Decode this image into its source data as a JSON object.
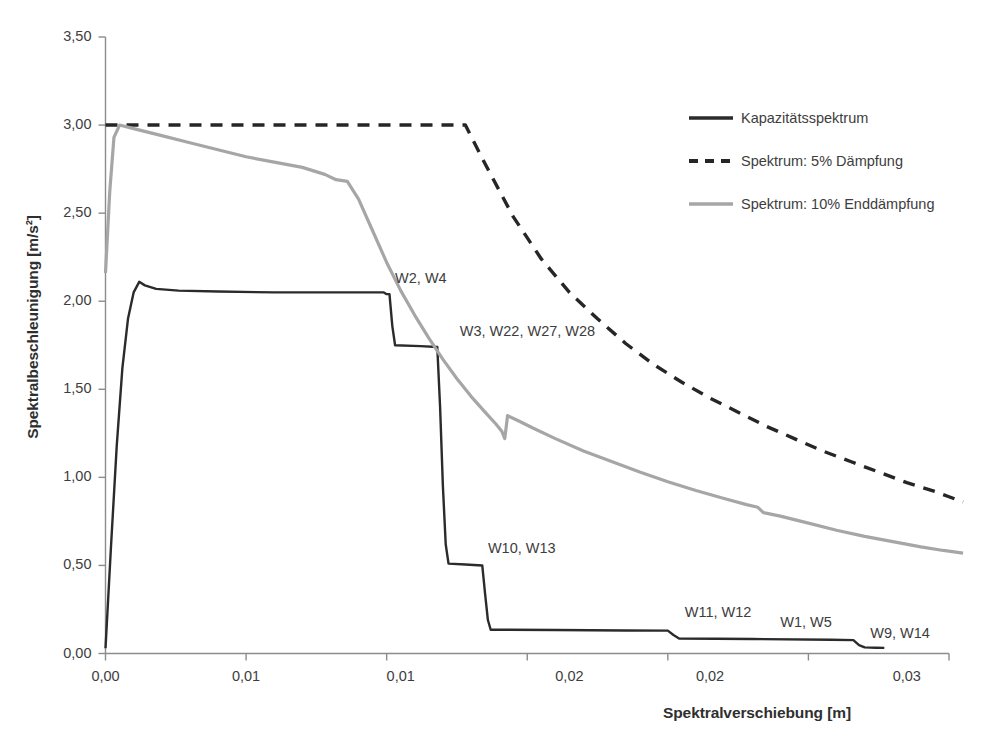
{
  "chart_data": {
    "type": "line",
    "title": "",
    "xlabel": "Spektralverschiebung [m]",
    "ylabel": "Spektralbeschleunigung [m/s²]",
    "xlim": [
      0,
      0.03
    ],
    "ylim": [
      0,
      3.5
    ],
    "grid": false,
    "legend_position": "top-right",
    "xticks": [
      0,
      0.005,
      0.01,
      0.015,
      0.02,
      0.025,
      0.03
    ],
    "xtick_labels": [
      "0,00",
      "0,01",
      "0,01",
      "0,02",
      "0,02",
      "0,03"
    ],
    "yticks": [
      0,
      0.5,
      1.0,
      1.5,
      2.0,
      2.5,
      3.0,
      3.5
    ],
    "ytick_labels": [
      "0,00",
      "0,50",
      "1,00",
      "1,50",
      "2,00",
      "2,50",
      "3,00",
      "3,50"
    ],
    "series": [
      {
        "name": "Kapazitätsspektrum",
        "style": "solid",
        "color": "#2b2b2b",
        "points": [
          [
            0.0,
            0.03
          ],
          [
            0.0002,
            0.62
          ],
          [
            0.0004,
            1.18
          ],
          [
            0.0006,
            1.62
          ],
          [
            0.0008,
            1.9
          ],
          [
            0.001,
            2.05
          ],
          [
            0.0012,
            2.11
          ],
          [
            0.0014,
            2.09
          ],
          [
            0.0018,
            2.07
          ],
          [
            0.0026,
            2.06
          ],
          [
            0.004,
            2.055
          ],
          [
            0.006,
            2.05
          ],
          [
            0.0085,
            2.05
          ],
          [
            0.0099,
            2.05
          ],
          [
            0.01,
            2.04
          ],
          [
            0.0101,
            2.04
          ],
          [
            0.0102,
            1.86
          ],
          [
            0.0103,
            1.75
          ],
          [
            0.0112,
            1.745
          ],
          [
            0.0118,
            1.74
          ],
          [
            0.0119,
            1.4
          ],
          [
            0.012,
            0.95
          ],
          [
            0.0121,
            0.62
          ],
          [
            0.0122,
            0.51
          ],
          [
            0.0128,
            0.505
          ],
          [
            0.0134,
            0.5
          ],
          [
            0.0135,
            0.34
          ],
          [
            0.0136,
            0.19
          ],
          [
            0.0137,
            0.135
          ],
          [
            0.016,
            0.133
          ],
          [
            0.0185,
            0.131
          ],
          [
            0.02,
            0.13
          ],
          [
            0.0202,
            0.105
          ],
          [
            0.0204,
            0.085
          ],
          [
            0.023,
            0.082
          ],
          [
            0.0258,
            0.078
          ],
          [
            0.0266,
            0.076
          ],
          [
            0.0268,
            0.048
          ],
          [
            0.027,
            0.035
          ],
          [
            0.0274,
            0.033
          ],
          [
            0.0277,
            0.032
          ]
        ]
      },
      {
        "name": "Spektrum: 5% Dämpfung",
        "style": "dashed",
        "color": "#262626",
        "points": [
          [
            0.0,
            3.0
          ],
          [
            0.002,
            3.0
          ],
          [
            0.004,
            3.0
          ],
          [
            0.006,
            3.0
          ],
          [
            0.008,
            3.0
          ],
          [
            0.01,
            3.0
          ],
          [
            0.0122,
            3.0
          ],
          [
            0.0128,
            3.0
          ],
          [
            0.0135,
            2.78
          ],
          [
            0.0145,
            2.48
          ],
          [
            0.0155,
            2.24
          ],
          [
            0.0165,
            2.05
          ],
          [
            0.0175,
            1.9
          ],
          [
            0.0185,
            1.76
          ],
          [
            0.0195,
            1.64
          ],
          [
            0.0205,
            1.54
          ],
          [
            0.0215,
            1.45
          ],
          [
            0.0225,
            1.37
          ],
          [
            0.0235,
            1.29
          ],
          [
            0.0245,
            1.22
          ],
          [
            0.0255,
            1.15
          ],
          [
            0.0265,
            1.09
          ],
          [
            0.0275,
            1.03
          ],
          [
            0.0285,
            0.97
          ],
          [
            0.0295,
            0.92
          ],
          [
            0.03,
            0.89
          ],
          [
            0.0305,
            0.86
          ]
        ]
      },
      {
        "name": "Spektrum: 10% Enddämpfung",
        "style": "solid",
        "color": "#a6a6a6",
        "points": [
          [
            0.0,
            2.16
          ],
          [
            0.00015,
            2.62
          ],
          [
            0.0003,
            2.93
          ],
          [
            0.0005,
            3.0
          ],
          [
            0.001,
            2.98
          ],
          [
            0.002,
            2.94
          ],
          [
            0.003,
            2.9
          ],
          [
            0.004,
            2.86
          ],
          [
            0.005,
            2.82
          ],
          [
            0.006,
            2.79
          ],
          [
            0.007,
            2.76
          ],
          [
            0.0078,
            2.72
          ],
          [
            0.0082,
            2.69
          ],
          [
            0.0086,
            2.68
          ],
          [
            0.009,
            2.58
          ],
          [
            0.0095,
            2.4
          ],
          [
            0.01,
            2.22
          ],
          [
            0.0105,
            2.06
          ],
          [
            0.011,
            1.92
          ],
          [
            0.0115,
            1.79
          ],
          [
            0.012,
            1.67
          ],
          [
            0.0125,
            1.56
          ],
          [
            0.013,
            1.46
          ],
          [
            0.0135,
            1.37
          ],
          [
            0.0139,
            1.3
          ],
          [
            0.0141,
            1.26
          ],
          [
            0.0142,
            1.22
          ],
          [
            0.0143,
            1.35
          ],
          [
            0.0147,
            1.32
          ],
          [
            0.0152,
            1.28
          ],
          [
            0.016,
            1.22
          ],
          [
            0.017,
            1.15
          ],
          [
            0.018,
            1.09
          ],
          [
            0.019,
            1.03
          ],
          [
            0.02,
            0.975
          ],
          [
            0.021,
            0.925
          ],
          [
            0.022,
            0.88
          ],
          [
            0.0228,
            0.845
          ],
          [
            0.0232,
            0.83
          ],
          [
            0.0234,
            0.8
          ],
          [
            0.024,
            0.78
          ],
          [
            0.025,
            0.74
          ],
          [
            0.026,
            0.7
          ],
          [
            0.027,
            0.665
          ],
          [
            0.028,
            0.635
          ],
          [
            0.029,
            0.605
          ],
          [
            0.0298,
            0.585
          ],
          [
            0.0305,
            0.57
          ]
        ]
      }
    ],
    "annotations": [
      {
        "text": "W2, W4",
        "x": 0.0103,
        "y": 2.12
      },
      {
        "text": "W3, W22, W27, W28",
        "x": 0.0126,
        "y": 1.82
      },
      {
        "text": "W10, W13",
        "x": 0.0136,
        "y": 0.59
      },
      {
        "text": "W11, W12",
        "x": 0.0206,
        "y": 0.225
      },
      {
        "text": "W1, W5",
        "x": 0.024,
        "y": 0.165
      },
      {
        "text": "W9, W14",
        "x": 0.0272,
        "y": 0.105
      }
    ]
  },
  "legend": {
    "items": [
      {
        "label": "Kapazitätsspektrum",
        "swatch": "solid-dark-line-icon"
      },
      {
        "label": "Spektrum: 5% Dämpfung",
        "swatch": "dashed-dark-line-icon"
      },
      {
        "label": "Spektrum: 10% Enddämpfung",
        "swatch": "solid-gray-line-icon"
      }
    ]
  },
  "colors": {
    "capacity": "#2b2b2b",
    "spectrum5": "#262626",
    "spectrum10": "#a6a6a6",
    "axis": "#8c8c8c",
    "text": "#3d3d3d"
  }
}
